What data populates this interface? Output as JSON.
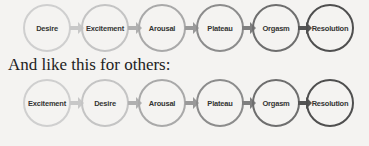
{
  "diagram_top": {
    "nodes": [
      {
        "label": "Desire",
        "color": "#cfcfcf"
      },
      {
        "label": "Excitement",
        "color": "#c4c4c4"
      },
      {
        "label": "Arousal",
        "color": "#a9a9a9"
      },
      {
        "label": "Plateau",
        "color": "#8c8c8c"
      },
      {
        "label": "Orgasm",
        "color": "#6e6e6e"
      },
      {
        "label": "Resolution",
        "color": "#4f4f4f"
      }
    ],
    "arrow_colors": [
      "#c8c8c8",
      "#b0b0b0",
      "#999999",
      "#7f7f7f",
      "#555555"
    ]
  },
  "caption": "And like this for others:",
  "diagram_bottom": {
    "nodes": [
      {
        "label": "Excitement",
        "color": "#cfcfcf"
      },
      {
        "label": "Desire",
        "color": "#c4c4c4"
      },
      {
        "label": "Arousal",
        "color": "#a9a9a9"
      },
      {
        "label": "Plateau",
        "color": "#8c8c8c"
      },
      {
        "label": "Orgasm",
        "color": "#6e6e6e"
      },
      {
        "label": "Resolution",
        "color": "#4f4f4f"
      }
    ],
    "arrow_colors": [
      "#c8c8c8",
      "#b0b0b0",
      "#999999",
      "#7f7f7f",
      "#555555"
    ]
  }
}
